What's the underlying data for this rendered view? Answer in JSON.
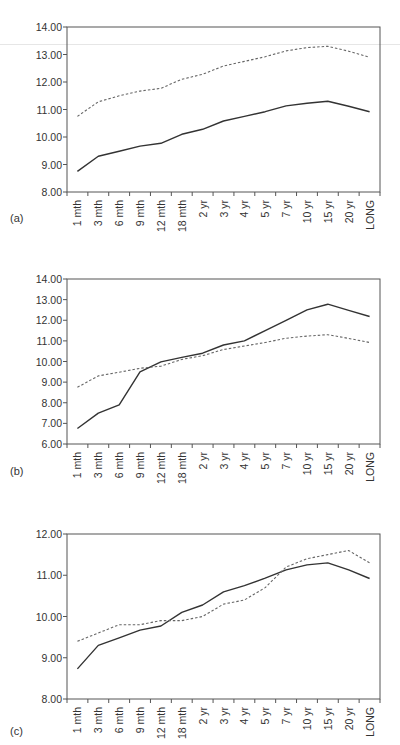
{
  "chart_data": [
    {
      "type": "line",
      "panel_label": "(a)",
      "title": "",
      "xlabel": "",
      "ylabel": "",
      "categories": [
        "1 mth",
        "3 mth",
        "6 mth",
        "9 mth",
        "12 mth",
        "18 mth",
        "2 yr",
        "3 yr",
        "4 yr",
        "5 yr",
        "7 yr",
        "10 yr",
        "15 yr",
        "20 yr",
        "LONG"
      ],
      "ylim": [
        8,
        14
      ],
      "yticks": [
        "8.00",
        "9.00",
        "10.00",
        "11.00",
        "12.00",
        "13.00",
        "14.00"
      ],
      "grid": false,
      "legend": null,
      "series": [
        {
          "name": "solid",
          "style": "solid",
          "color": "#333333",
          "values": [
            8.75,
            9.3,
            9.48,
            9.67,
            9.77,
            10.1,
            10.28,
            10.58,
            10.75,
            10.92,
            11.13,
            11.23,
            11.3,
            11.12,
            10.92
          ]
        },
        {
          "name": "dashed",
          "style": "dashed",
          "color": "#666666",
          "values": [
            10.75,
            11.28,
            11.5,
            11.67,
            11.77,
            12.1,
            12.28,
            12.58,
            12.75,
            12.92,
            13.13,
            13.25,
            13.3,
            13.12,
            12.9
          ]
        }
      ]
    },
    {
      "type": "line",
      "panel_label": "(b)",
      "title": "",
      "xlabel": "",
      "ylabel": "",
      "categories": [
        "1 mth",
        "3 mth",
        "6 mth",
        "9 mth",
        "12 mth",
        "18 mth",
        "2 yr",
        "3 yr",
        "4 yr",
        "5 yr",
        "7 yr",
        "10 yr",
        "15 yr",
        "20 yr",
        "LONG"
      ],
      "ylim": [
        6,
        14
      ],
      "yticks": [
        "6.00",
        "7.00",
        "8.00",
        "9.00",
        "10.00",
        "11.00",
        "12.00",
        "13.00",
        "14.00"
      ],
      "grid": false,
      "legend": null,
      "series": [
        {
          "name": "solid",
          "style": "solid",
          "color": "#333333",
          "values": [
            6.75,
            7.5,
            7.9,
            9.5,
            9.98,
            10.2,
            10.4,
            10.8,
            11.0,
            11.5,
            12.0,
            12.5,
            12.78,
            12.48,
            12.18
          ]
        },
        {
          "name": "dashed",
          "style": "dashed",
          "color": "#666666",
          "values": [
            8.75,
            9.3,
            9.48,
            9.67,
            9.77,
            10.1,
            10.28,
            10.58,
            10.75,
            10.92,
            11.13,
            11.23,
            11.3,
            11.12,
            10.92
          ]
        }
      ]
    },
    {
      "type": "line",
      "panel_label": "(c)",
      "title": "",
      "xlabel": "",
      "ylabel": "",
      "categories": [
        "1 mth",
        "3 mth",
        "6 mth",
        "9 mth",
        "12 mth",
        "18 mth",
        "2 yr",
        "3 yr",
        "4 yr",
        "5 yr",
        "7 yr",
        "10 yr",
        "15 yr",
        "20 yr",
        "LONG"
      ],
      "ylim": [
        8,
        12
      ],
      "yticks": [
        "8.00",
        "9.00",
        "10.00",
        "11.00",
        "12.00"
      ],
      "grid": false,
      "legend": null,
      "series": [
        {
          "name": "solid",
          "style": "solid",
          "color": "#333333",
          "values": [
            8.73,
            9.3,
            9.48,
            9.67,
            9.77,
            10.1,
            10.28,
            10.6,
            10.75,
            10.93,
            11.13,
            11.25,
            11.3,
            11.13,
            10.92
          ]
        },
        {
          "name": "dashed",
          "style": "dashed",
          "color": "#666666",
          "values": [
            9.4,
            9.6,
            9.8,
            9.8,
            9.9,
            9.9,
            10.0,
            10.3,
            10.4,
            10.7,
            11.2,
            11.4,
            11.5,
            11.6,
            11.3
          ]
        }
      ]
    }
  ]
}
